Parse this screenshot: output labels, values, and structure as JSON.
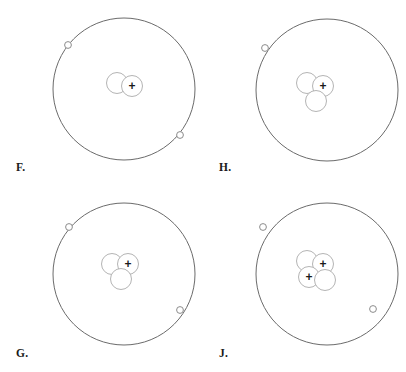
{
  "figure": {
    "type": "atomic-model-diagram-set",
    "background_color": "#ffffff",
    "orbit_stroke_color": "#6b6b6b",
    "nucleon_stroke_color": "#b4b4b4",
    "electron_stroke_color": "#8c8c8c",
    "charge_symbol_color": "#1a1a1a",
    "label_color": "#1a1a1a",
    "proton_symbol": "+",
    "neutron_symbol": ""
  },
  "diagrams": [
    {
      "id": "F",
      "label": "F.",
      "position": "top-left",
      "orbit": {
        "cx": 124,
        "cy": 89,
        "r": 71
      },
      "electron_count": 2,
      "electrons": [
        {
          "cx": 68,
          "cy": 45,
          "r": 3.4
        },
        {
          "cx": 180,
          "cy": 135,
          "r": 3.4
        }
      ],
      "proton_count": 1,
      "neutron_count": 1,
      "nucleon_total": 2,
      "nucleons": [
        {
          "cx": 117,
          "cy": 83,
          "r": 10.5,
          "charge": ""
        },
        {
          "cx": 132,
          "cy": 86,
          "r": 10.5,
          "charge": "+"
        }
      ]
    },
    {
      "id": "H",
      "label": "H.",
      "position": "top-right",
      "orbit": {
        "cx": 124,
        "cy": 90,
        "r": 71
      },
      "electron_count": 1,
      "electrons": [
        {
          "cx": 62,
          "cy": 48,
          "r": 3.4
        }
      ],
      "proton_count": 1,
      "neutron_count": 2,
      "nucleon_total": 3,
      "nucleons": [
        {
          "cx": 104,
          "cy": 83,
          "r": 10.5,
          "charge": ""
        },
        {
          "cx": 120,
          "cy": 86,
          "r": 10.5,
          "charge": "+"
        },
        {
          "cx": 113,
          "cy": 101,
          "r": 10.5,
          "charge": ""
        }
      ]
    },
    {
      "id": "G",
      "label": "G.",
      "position": "bottom-left",
      "orbit": {
        "cx": 124,
        "cy": 88,
        "r": 71
      },
      "electron_count": 2,
      "electrons": [
        {
          "cx": 69,
          "cy": 41,
          "r": 3.4
        },
        {
          "cx": 180,
          "cy": 124,
          "r": 3.4
        }
      ],
      "proton_count": 1,
      "neutron_count": 2,
      "nucleon_total": 3,
      "nucleons": [
        {
          "cx": 112,
          "cy": 78,
          "r": 10.5,
          "charge": ""
        },
        {
          "cx": 128,
          "cy": 78,
          "r": 10.5,
          "charge": "+"
        },
        {
          "cx": 121,
          "cy": 93,
          "r": 10.5,
          "charge": ""
        }
      ]
    },
    {
      "id": "J",
      "label": "J.",
      "position": "bottom-right",
      "orbit": {
        "cx": 124,
        "cy": 88,
        "r": 71
      },
      "electron_count": 2,
      "electrons": [
        {
          "cx": 60,
          "cy": 41,
          "r": 3.4
        },
        {
          "cx": 170,
          "cy": 123,
          "r": 3.4
        }
      ],
      "proton_count": 2,
      "neutron_count": 2,
      "nucleon_total": 4,
      "nucleons": [
        {
          "cx": 104,
          "cy": 75,
          "r": 10.5,
          "charge": ""
        },
        {
          "cx": 120,
          "cy": 78,
          "r": 10.5,
          "charge": "+"
        },
        {
          "cx": 106,
          "cy": 91,
          "r": 10.5,
          "charge": "+"
        },
        {
          "cx": 122,
          "cy": 94,
          "r": 10.5,
          "charge": ""
        }
      ]
    }
  ],
  "cell_positions": [
    {
      "left": 0,
      "top": 0
    },
    {
      "left": 203,
      "top": 0
    },
    {
      "left": 0,
      "top": 186
    },
    {
      "left": 203,
      "top": 186
    }
  ],
  "label_positions": [
    {
      "left": 16,
      "top": 162
    },
    {
      "left": 16,
      "top": 162
    },
    {
      "left": 16,
      "top": 162
    },
    {
      "left": 16,
      "top": 162
    }
  ]
}
